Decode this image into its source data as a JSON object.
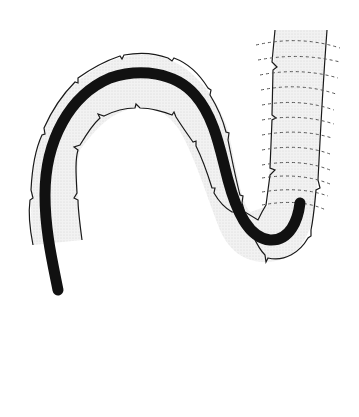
{
  "figure": {
    "colors": {
      "background": "#ffffff",
      "lumen_fill": "#ececec",
      "wall_stroke": "#1a1a1a",
      "scope": "#111111",
      "haustra_dash": "#555555"
    },
    "elements": [
      {
        "name": "colon-wall",
        "description": "Curved bowel segment with haustral folds"
      },
      {
        "name": "endoscope",
        "description": "Thick black flexible scope following the lumen"
      },
      {
        "name": "haustral-lines",
        "count": 12,
        "description": "Dashed transverse fold lines on ascending segment"
      }
    ]
  }
}
